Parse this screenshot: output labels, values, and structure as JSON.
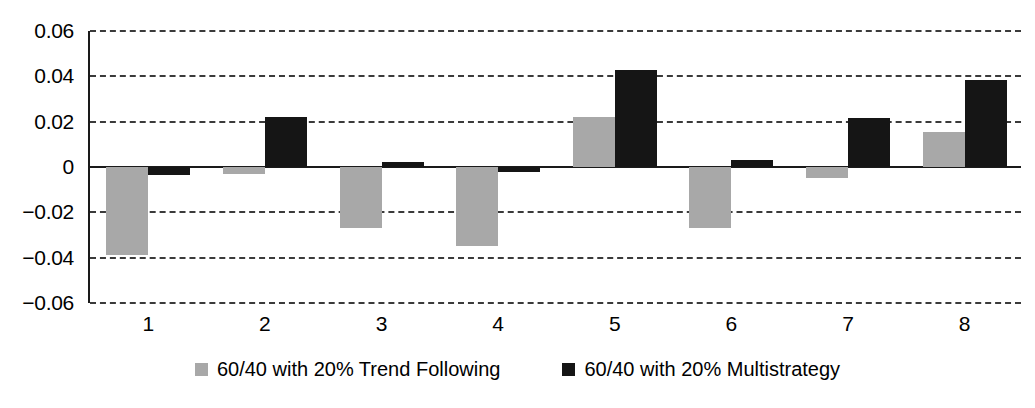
{
  "chart_data": {
    "type": "bar",
    "title": "",
    "xlabel": "",
    "ylabel": "",
    "categories": [
      "1",
      "2",
      "3",
      "4",
      "5",
      "6",
      "7",
      "8"
    ],
    "ylim": [
      -0.06,
      0.06
    ],
    "yticks": [
      0.06,
      0.04,
      0.02,
      0,
      -0.02,
      -0.04,
      -0.06
    ],
    "ytick_labels": [
      "0.06",
      "0.04",
      "0.02",
      "0",
      "−0.02",
      "−0.04",
      "−0.06"
    ],
    "grid": true,
    "legend_position": "bottom",
    "series": [
      {
        "name": "60/40 with 20% Trend Following",
        "color": "#a8a8a8",
        "values": [
          -0.039,
          -0.003,
          -0.027,
          -0.035,
          0.022,
          -0.027,
          -0.005,
          0.0155
        ]
      },
      {
        "name": "60/40 with 20% Multistrategy",
        "color": "#151515",
        "values": [
          -0.0035,
          0.022,
          0.002,
          -0.002,
          0.043,
          0.003,
          0.0215,
          0.0385
        ]
      }
    ]
  },
  "legend": {
    "items": [
      {
        "label": "60/40 with 20% Trend Following",
        "swatch": "gray"
      },
      {
        "label": "60/40 with 20% Multistrategy",
        "swatch": "black"
      }
    ]
  }
}
